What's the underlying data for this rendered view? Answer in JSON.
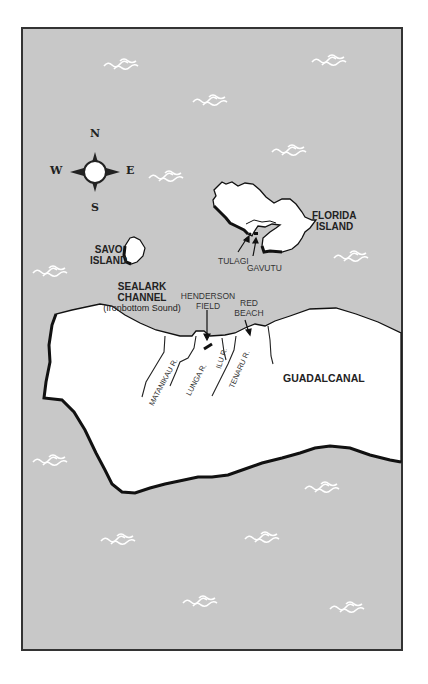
{
  "map": {
    "colors": {
      "sea": "#c8c8c8",
      "land": "#ffffff",
      "coast": "#111111",
      "frame": "#333333",
      "wave": "#ffffff"
    },
    "compass": {
      "north": "N",
      "south": "S",
      "east": "E",
      "west": "W"
    },
    "islands": {
      "florida": "FLORIDA\nISLAND",
      "florida_line1": "FLORIDA",
      "florida_line2": "ISLAND",
      "savo_line1": "SAVO",
      "savo_line2": "ISLAND",
      "guadalcanal": "GUADALCANAL"
    },
    "places": {
      "tulagi": "TULAGI",
      "gavutu": "GAVUTU",
      "henderson_line1": "HENDERSON",
      "henderson_line2": "FIELD",
      "red_beach_line1": "RED",
      "red_beach_line2": "BEACH"
    },
    "channel": {
      "line1": "SEALARK",
      "line2": "CHANNEL",
      "line3": "(Ironbottom Sound)"
    },
    "rivers": {
      "matanikau": "MATANIKAU R.",
      "lunga": "LUNGA R.",
      "ilu": "ILU R.",
      "tenaru": "TENARU R."
    }
  }
}
